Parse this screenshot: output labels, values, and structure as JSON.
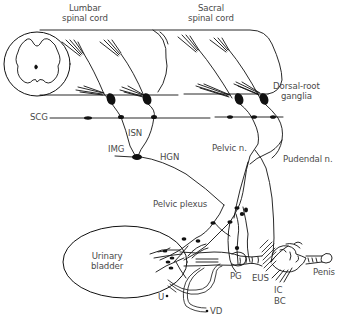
{
  "diagram": {
    "type": "anatomical-schematic",
    "colors": {
      "line": "#111111",
      "label": "#4a4a4a",
      "background": "#ffffff"
    },
    "labels": {
      "lumbar_cord_line1": "Lumbar",
      "lumbar_cord_line2": "spinal cord",
      "sacral_cord_line1": "Sacral",
      "sacral_cord_line2": "spinal cord",
      "drg_line1": "Dorsal-root",
      "drg_line2": "ganglia",
      "scg": "SCG",
      "isn": "ISN",
      "img": "IMG",
      "hgn": "HGN",
      "pelvic_n": "Pelvic n.",
      "pudendal_n": "Pudendal n.",
      "pelvic_plexus": "Pelvic plexus",
      "bladder_line1": "Urinary",
      "bladder_line2": "bladder",
      "pg": "PG",
      "eus": "EUS",
      "ic": "IC",
      "bc": "BC",
      "penis": "Penis",
      "u": "U",
      "vd": "VD"
    },
    "nodes": [
      {
        "id": "lumbar-cord",
        "label": "Lumbar spinal cord"
      },
      {
        "id": "sacral-cord",
        "label": "Sacral spinal cord"
      },
      {
        "id": "dorsal-root-ganglia",
        "label": "Dorsal-root ganglia"
      },
      {
        "id": "scg",
        "label": "SCG"
      },
      {
        "id": "img",
        "label": "IMG"
      },
      {
        "id": "pelvic-plexus",
        "label": "Pelvic plexus"
      },
      {
        "id": "urinary-bladder",
        "label": "Urinary bladder"
      },
      {
        "id": "pg",
        "label": "PG"
      },
      {
        "id": "eus",
        "label": "EUS"
      },
      {
        "id": "ic",
        "label": "IC"
      },
      {
        "id": "bc",
        "label": "BC"
      },
      {
        "id": "penis",
        "label": "Penis"
      },
      {
        "id": "u",
        "label": "U"
      },
      {
        "id": "vd",
        "label": "VD"
      }
    ],
    "edges": [
      {
        "from": "lumbar-cord",
        "to": "img",
        "label": "ISN"
      },
      {
        "from": "img",
        "to": "pelvic-plexus",
        "label": "HGN"
      },
      {
        "from": "sacral-cord",
        "to": "pelvic-plexus",
        "label": "Pelvic n."
      },
      {
        "from": "sacral-cord",
        "to": "eus",
        "label": "Pudendal n."
      },
      {
        "from": "pelvic-plexus",
        "to": "urinary-bladder",
        "label": ""
      },
      {
        "from": "pelvic-plexus",
        "to": "pg",
        "label": ""
      },
      {
        "from": "scg",
        "to": "lumbar-cord",
        "label": "sympathetic chain"
      }
    ]
  }
}
